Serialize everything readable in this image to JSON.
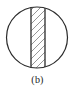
{
  "figure": {
    "caption": "(b)",
    "diagram_type": "circle-with-hatched-vertical-band",
    "colors": {
      "background": "#ffffff",
      "outline": "#2b2b2b",
      "chord_line": "#3a3a3a",
      "hatch_line": "#8a8a8a",
      "caption_text": "#1a1a1a"
    },
    "circle": {
      "center_x": 37,
      "center_y": 37.5,
      "radius": 30.5,
      "stroke_width": 1.2
    },
    "band": {
      "left_x": 31,
      "right_x": 45,
      "stroke_width": 1.4,
      "hatch_direction": "lower-left-to-upper-right",
      "hatch_count": 8,
      "hatch_spacing": 7,
      "hatch_stroke_width": 0.9
    }
  }
}
